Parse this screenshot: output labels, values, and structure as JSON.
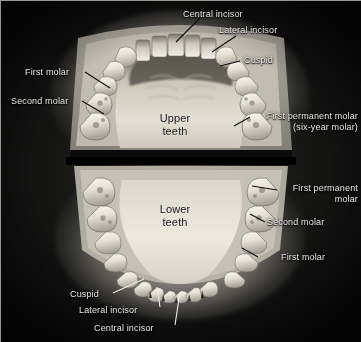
{
  "figure": {
    "background_color": "#0a0a0a",
    "label_color": "#e9e7e2",
    "center_label_color": "#17171a"
  },
  "center_labels": [
    {
      "id": "upper",
      "line1": "Upper",
      "line2": "teeth"
    },
    {
      "id": "lower",
      "line1": "Lower",
      "line2": "teeth"
    }
  ],
  "callouts": [
    {
      "id": "central-incisor-upper",
      "text": "Central incisor"
    },
    {
      "id": "lateral-incisor-upper",
      "text": "Lateral incisor"
    },
    {
      "id": "cuspid-upper",
      "text": "Cuspid"
    },
    {
      "id": "first-molar-upper-left",
      "text": "First molar"
    },
    {
      "id": "second-molar-upper-left",
      "text": "Second molar"
    },
    {
      "id": "first-permanent-molar-upper",
      "line1": "First permanent molar",
      "line2": "(six-year molar)"
    },
    {
      "id": "first-permanent-molar-lower",
      "line1": "First permanent",
      "line2": "molar"
    },
    {
      "id": "second-molar-lower",
      "text": "Second molar"
    },
    {
      "id": "first-molar-lower",
      "text": "First molar"
    },
    {
      "id": "cuspid-lower",
      "text": "Cuspid"
    },
    {
      "id": "lateral-incisor-lower",
      "text": "Lateral incisor"
    },
    {
      "id": "central-incisor-lower",
      "text": "Central incisor"
    }
  ]
}
